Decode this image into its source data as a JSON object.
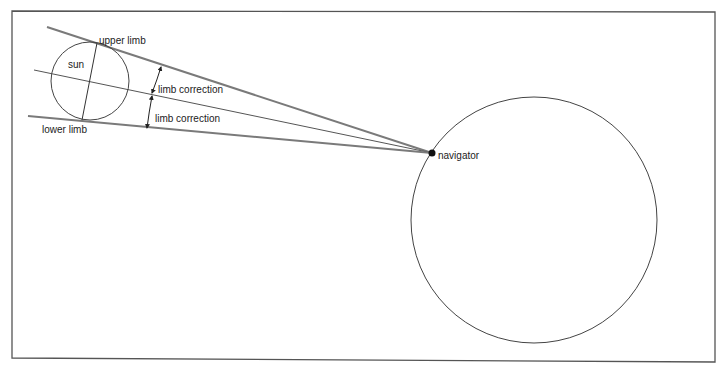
{
  "diagram": {
    "colors": {
      "frame": "#555555",
      "tangent_line": "#7a7a7a",
      "center_line": "#555555",
      "circle": "#444444",
      "text": "#222222"
    },
    "labels": {
      "upper_limb": "upper limb",
      "lower_limb": "lower limb",
      "sun": "sun",
      "limb_correction_upper": "limb correction",
      "limb_correction_lower": "limb correction",
      "navigator": "navigator"
    },
    "elements": {
      "sun": {
        "cx": 90,
        "cy": 81,
        "r": 39
      },
      "earth": {
        "cx": 534,
        "cy": 220,
        "r": 123
      },
      "navigator_point": {
        "x": 432,
        "y": 153
      }
    }
  }
}
